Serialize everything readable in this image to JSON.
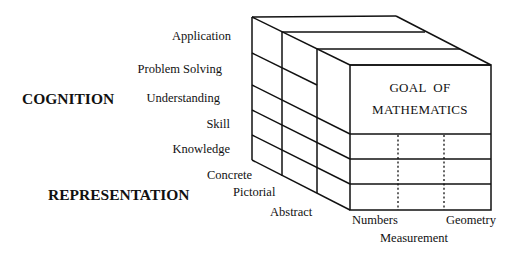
{
  "diagram": {
    "axes": {
      "cognition": {
        "title": "COGNITION",
        "levels": [
          "Application",
          "Problem Solving",
          "Understanding",
          "Skill",
          "Knowledge"
        ]
      },
      "representation": {
        "title": "REPRESENTATION",
        "levels": [
          "Concrete",
          "Pictorial",
          "Abstract"
        ]
      },
      "content": {
        "levels": [
          "Numbers",
          "Measurement",
          "Geometry"
        ]
      }
    },
    "front_face": {
      "line1": "GOAL  OF",
      "line2": "MATHEMATICS"
    },
    "colors": {
      "line": "#111111",
      "background": "#ffffff"
    }
  }
}
